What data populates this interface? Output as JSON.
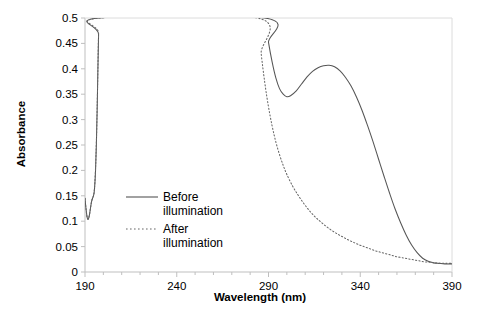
{
  "chart_data": {
    "type": "line",
    "title": "",
    "xlabel": "Wavelength (nm)",
    "ylabel": "Absorbance",
    "xlim": [
      190,
      390
    ],
    "ylim": [
      0,
      0.5
    ],
    "xticks": [
      190,
      240,
      290,
      340,
      390
    ],
    "xtick_labels": [
      "190",
      "240",
      "290",
      "340",
      "390"
    ],
    "xtick_minor_step": 10,
    "yticks": [
      0,
      0.05,
      0.1,
      0.15,
      0.2,
      0.25,
      0.3,
      0.35,
      0.4,
      0.45,
      0.5
    ],
    "ytick_labels": [
      "0",
      "0.05",
      "0.1",
      "0.15",
      "0.2",
      "0.25",
      "0.3",
      "0.35",
      "0.4",
      "0.45",
      "0.5"
    ],
    "grid": false,
    "legend_position": "center-left",
    "series": [
      {
        "name": "Before illumination",
        "label_line1": "Before",
        "label_line2": "illumination",
        "style": "solid",
        "color": "#555555",
        "points": [
          [
            190.0,
            0.145
          ],
          [
            190.6,
            0.123
          ],
          [
            191.2,
            0.107
          ],
          [
            191.8,
            0.104
          ],
          [
            192.4,
            0.112
          ],
          [
            193.0,
            0.126
          ],
          [
            193.6,
            0.139
          ],
          [
            194.2,
            0.146
          ],
          [
            194.6,
            0.15
          ],
          [
            195.0,
            0.157
          ],
          [
            195.4,
            0.175
          ],
          [
            195.8,
            0.205
          ],
          [
            196.2,
            0.252
          ],
          [
            196.6,
            0.315
          ],
          [
            197.0,
            0.392
          ],
          [
            197.4,
            0.468
          ],
          [
            197.7,
            0.5
          ],
          [
            288.0,
            0.5
          ],
          [
            290.0,
            0.452
          ],
          [
            292.0,
            0.413
          ],
          [
            294.0,
            0.382
          ],
          [
            296.0,
            0.361
          ],
          [
            298.0,
            0.35
          ],
          [
            300.0,
            0.345
          ],
          [
            302.0,
            0.347
          ],
          [
            305.0,
            0.356
          ],
          [
            308.0,
            0.37
          ],
          [
            311.0,
            0.384
          ],
          [
            314.0,
            0.395
          ],
          [
            317.0,
            0.402
          ],
          [
            320.0,
            0.406
          ],
          [
            323.0,
            0.407
          ],
          [
            326.0,
            0.404
          ],
          [
            329.0,
            0.396
          ],
          [
            332.0,
            0.383
          ],
          [
            335.0,
            0.366
          ],
          [
            338.0,
            0.344
          ],
          [
            341.0,
            0.318
          ],
          [
            344.0,
            0.288
          ],
          [
            347.0,
            0.256
          ],
          [
            350.0,
            0.222
          ],
          [
            353.0,
            0.188
          ],
          [
            356.0,
            0.155
          ],
          [
            359.0,
            0.124
          ],
          [
            362.0,
            0.097
          ],
          [
            365.0,
            0.073
          ],
          [
            368.0,
            0.053
          ],
          [
            371.0,
            0.038
          ],
          [
            374.0,
            0.027
          ],
          [
            377.0,
            0.021
          ],
          [
            380.0,
            0.018
          ],
          [
            383.0,
            0.017
          ],
          [
            386.0,
            0.016
          ],
          [
            390.0,
            0.016
          ]
        ]
      },
      {
        "name": "After illumination",
        "label_line1": "After",
        "label_line2": "illumination",
        "style": "dotted",
        "color": "#666666",
        "points": [
          [
            190.0,
            0.145
          ],
          [
            190.6,
            0.123
          ],
          [
            191.2,
            0.107
          ],
          [
            191.8,
            0.104
          ],
          [
            192.4,
            0.112
          ],
          [
            193.0,
            0.126
          ],
          [
            193.6,
            0.139
          ],
          [
            194.2,
            0.146
          ],
          [
            194.6,
            0.15
          ],
          [
            195.0,
            0.158
          ],
          [
            195.4,
            0.178
          ],
          [
            195.8,
            0.21
          ],
          [
            196.2,
            0.256
          ],
          [
            196.6,
            0.318
          ],
          [
            197.0,
            0.394
          ],
          [
            197.4,
            0.47
          ],
          [
            197.7,
            0.5
          ],
          [
            284.0,
            0.5
          ],
          [
            286.0,
            0.43
          ],
          [
            288.0,
            0.372
          ],
          [
            290.0,
            0.325
          ],
          [
            292.0,
            0.287
          ],
          [
            294.0,
            0.256
          ],
          [
            296.0,
            0.231
          ],
          [
            298.0,
            0.21
          ],
          [
            300.0,
            0.192
          ],
          [
            303.0,
            0.17
          ],
          [
            306.0,
            0.152
          ],
          [
            309.0,
            0.136
          ],
          [
            312.0,
            0.122
          ],
          [
            315.0,
            0.11
          ],
          [
            318.0,
            0.1
          ],
          [
            321.0,
            0.091
          ],
          [
            324.0,
            0.083
          ],
          [
            327.0,
            0.076
          ],
          [
            330.0,
            0.07
          ],
          [
            333.0,
            0.064
          ],
          [
            336.0,
            0.059
          ],
          [
            339.0,
            0.054
          ],
          [
            342.0,
            0.05
          ],
          [
            345.0,
            0.046
          ],
          [
            348.0,
            0.042
          ],
          [
            351.0,
            0.039
          ],
          [
            354.0,
            0.036
          ],
          [
            357.0,
            0.033
          ],
          [
            360.0,
            0.03
          ],
          [
            363.0,
            0.028
          ],
          [
            366.0,
            0.026
          ],
          [
            369.0,
            0.024
          ],
          [
            372.0,
            0.022
          ],
          [
            375.0,
            0.02
          ],
          [
            378.0,
            0.019
          ],
          [
            381.0,
            0.018
          ],
          [
            384.0,
            0.017
          ],
          [
            387.0,
            0.017
          ],
          [
            390.0,
            0.017
          ]
        ]
      }
    ]
  },
  "colors": {
    "axis": "#bfbfbf",
    "tick": "#bfbfbf",
    "text": "#000000",
    "background": "#ffffff",
    "series_before": "#555555",
    "series_after": "#666666"
  }
}
